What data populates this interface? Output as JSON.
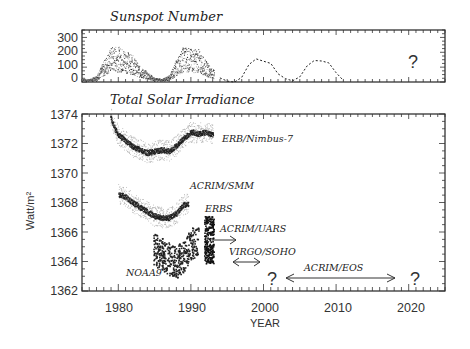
{
  "chart_data": [
    {
      "type": "line",
      "title": "Sunspot Number",
      "xlabel": "",
      "ylabel": "",
      "xlim": [
        1975,
        2025
      ],
      "ylim": [
        0,
        350
      ],
      "yticks": [
        "0",
        "100",
        "200",
        "300"
      ],
      "series": [
        {
          "name": "Observed sunspot number",
          "style": "dense dots",
          "x": [
            1975,
            1976,
            1977,
            1978,
            1979,
            1980,
            1981,
            1982,
            1983,
            1984,
            1985,
            1986,
            1987,
            1988,
            1989,
            1990,
            1991,
            1992,
            1993
          ],
          "values": [
            15,
            12,
            30,
            95,
            155,
            155,
            140,
            115,
            65,
            45,
            18,
            14,
            30,
            100,
            160,
            145,
            145,
            95,
            55
          ]
        },
        {
          "name": "Predicted sunspot number",
          "style": "dashed",
          "x": [
            1994,
            1995,
            1996,
            1997,
            1998,
            1999,
            2000,
            2001,
            2002,
            2003,
            2004,
            2005,
            2006,
            2007,
            2008,
            2009,
            2010,
            2011
          ],
          "values": [
            20,
            10,
            8,
            40,
            120,
            155,
            145,
            130,
            60,
            15,
            10,
            30,
            110,
            150,
            145,
            135,
            70,
            10
          ]
        }
      ],
      "annotations": [
        {
          "text": "?",
          "x": 2020,
          "y": 100
        }
      ]
    },
    {
      "type": "scatter",
      "title": "Total Solar Irradiance",
      "xlabel": "YEAR",
      "ylabel": "Watt/m²",
      "xlim": [
        1975,
        2025
      ],
      "ylim": [
        1362,
        1374
      ],
      "xticks": [
        "1980",
        "1990",
        "2000",
        "2010",
        "2020"
      ],
      "yticks": [
        "1362",
        "1364",
        "1366",
        "1368",
        "1370",
        "1372",
        "1374"
      ],
      "series": [
        {
          "name": "ERB/Nimbus-7",
          "x": [
            1978.9,
            1979.5,
            1980,
            1981,
            1982,
            1983,
            1984,
            1985,
            1986,
            1987,
            1988,
            1989,
            1990,
            1991,
            1992,
            1993
          ],
          "values": [
            1373.8,
            1373.0,
            1372.6,
            1372.2,
            1371.8,
            1371.6,
            1371.4,
            1371.5,
            1371.6,
            1371.5,
            1371.9,
            1372.4,
            1372.8,
            1372.7,
            1372.8,
            1372.6
          ]
        },
        {
          "name": "ACRIM/SMM",
          "x": [
            1980,
            1981,
            1982,
            1983,
            1984,
            1985,
            1986,
            1987,
            1988,
            1989
          ],
          "values": [
            1368.6,
            1368.4,
            1368.0,
            1367.7,
            1367.4,
            1367.1,
            1367.0,
            1367.0,
            1367.3,
            1367.9
          ]
        },
        {
          "name": "ERBS",
          "x": [
            1985,
            1986,
            1987,
            1988,
            1989,
            1990,
            1991,
            1992,
            1993
          ],
          "values": [
            1365.2,
            1365.0,
            1364.6,
            1364.5,
            1364.9,
            1365.4,
            1365.6,
            1365.8,
            1365.5
          ]
        },
        {
          "name": "NOAA9",
          "x": [
            1985,
            1986,
            1987,
            1988,
            1989
          ],
          "values": [
            1364.8,
            1364.5,
            1364.2,
            1364.0,
            1364.4
          ]
        }
      ],
      "annotations": [
        {
          "text": "ERB/Nimbus-7",
          "x": 1994,
          "y": 1372
        },
        {
          "text": "ACRIM/SMM",
          "x": 1990,
          "y": 1369
        },
        {
          "text": "ERBS",
          "x": 1992,
          "y": 1367.6
        },
        {
          "text": "ACRIM/UARS",
          "x": 1994,
          "y": 1366.2,
          "arrow": [
            1992,
            1996
          ]
        },
        {
          "text": "VIRGO/SOHO",
          "x": 1995,
          "y": 1364.8,
          "arrow": [
            1996,
            2000
          ]
        },
        {
          "text": "NOAA9",
          "x": 1981,
          "y": 1363.3
        },
        {
          "text": "ACRIM/EOS",
          "x": 2005,
          "y": 1363.8,
          "arrow": [
            2003,
            2018
          ]
        },
        {
          "text": "?",
          "x": 2001,
          "y": 1363.2
        },
        {
          "text": "?",
          "x": 2021,
          "y": 1363.2
        }
      ]
    }
  ],
  "labels": {
    "top_title": "Sunspot Number",
    "bottom_title": "Total Solar Irradiance",
    "xlabel": "YEAR",
    "ylabel": "Watt/m²",
    "top_yticks": [
      "300",
      "200",
      "100",
      "0"
    ],
    "bottom_yticks": [
      "1374",
      "1372",
      "1370",
      "1368",
      "1366",
      "1364",
      "1362"
    ],
    "xticks": [
      "1980",
      "1990",
      "2000",
      "2010",
      "2020"
    ],
    "ann_nimbus": "ERB/Nimbus-7",
    "ann_smm": "ACRIM/SMM",
    "ann_erbs": "ERBS",
    "ann_uars": "ACRIM/UARS",
    "ann_virgo": "VIRGO/SOHO",
    "ann_noaa": "NOAA9",
    "ann_eos": "ACRIM/EOS",
    "question": "?"
  }
}
